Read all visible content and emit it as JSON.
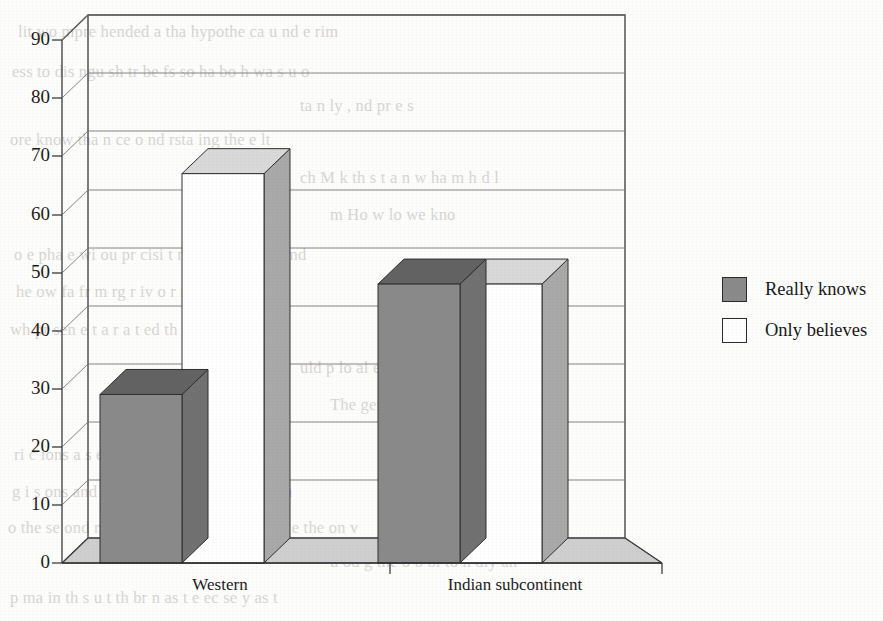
{
  "chart_data": {
    "type": "bar",
    "title": "",
    "subtitle": "",
    "xlabel": "",
    "ylabel": "",
    "categories": [
      "Western",
      "Indian subcontinent"
    ],
    "series": [
      {
        "name": "Really knows",
        "values": [
          29,
          48
        ],
        "color": "#8a8a8a"
      },
      {
        "name": "Only believes",
        "values": [
          67,
          48
        ],
        "color": "#ffffff"
      }
    ],
    "ylim": [
      0,
      90
    ],
    "yticks": [
      0,
      10,
      20,
      30,
      40,
      50,
      60,
      70,
      80,
      90
    ],
    "ytick_labels": [
      "0",
      "10",
      "20",
      "30",
      "40",
      "50",
      "60",
      "70",
      "80",
      "90"
    ],
    "grid": true,
    "grid_axis": "y",
    "legend_position": "right",
    "three_d": true,
    "annotations": []
  },
  "legend": {
    "entries": [
      {
        "label": "Really knows",
        "swatch_color": "#8a8a8a"
      },
      {
        "label": "Only believes",
        "swatch_color": "#ffffff"
      }
    ]
  },
  "axes": {
    "y_tick_labels": [
      "90",
      "80",
      "70",
      "60",
      "50",
      "40",
      "30",
      "20",
      "10",
      "0"
    ],
    "x_tick_labels": [
      "Western",
      "Indian subcontinent"
    ]
  },
  "colors": {
    "bar_gray_front": "#8a8a8a",
    "bar_gray_top": "#636363",
    "bar_gray_side": "#717171",
    "bar_white_front": "#ffffff",
    "bar_white_top": "#d9d9d9",
    "bar_white_side": "#a9a9a9",
    "floor": "#cfcfcf",
    "gridline": "#777777",
    "frame": "#3a3a3a",
    "text": "#1d1b19",
    "page_background": "#fdfdfc",
    "bleed_text": "#b9b7b2"
  },
  "page_bleed_text": [
    "lit    wo   mpre hended  a   tha  hypothe    ca  u   nd e   rim",
    "ess   to  dis ngu sh  tr   be   fs  so   ha    bo h   wa s  u o",
    "ta  n   ly ,  nd     pr e s",
    "ore  know   tha    n   ce     o    nd  rsta   ing   the  e      lt",
    "ch    M  k   th  s  t  a   n   w  ha   m  h   d   l",
    "m    Ho   w  lo   we  kno",
    "o e   pha e  wi  ou  pr cisi    t  no   d  s  i  be  i ved   nd",
    "he   ow    fa   fr m   rg   r    iv     o    r     m   d   uld e",
    "wh    pr  sen  e   t   a   r a  t   ed    th  be  p  osop   a   on",
    "uld  p    lo       al   e p   e  e   p n   e     ys  i    l",
    "The  gene a   s     lu",
    "ri   c   ions a    s     ed   or   wi   thi    ho    ph   pr c    n  se",
    "g  i s  ons   and  m   a  ion   A   som  s   ag   on    h   yea",
    "o   the  se ond  nu  e   h  es  w ll be  b e  o  sim  la e  the     on  v",
    "u  od  g  the   o b  bl    to   n       dly an",
    "p    ma    in  th  s      u    t    th  br   n   as  t  e  ec se  y    as   t"
  ]
}
